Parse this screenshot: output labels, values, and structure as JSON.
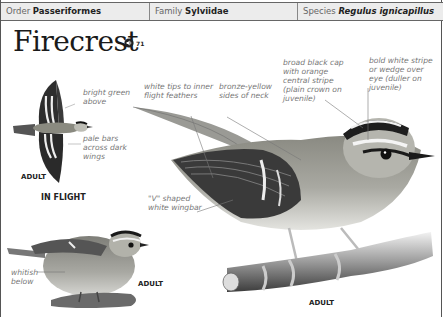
{
  "header": {
    "order": {
      "label": "Order",
      "value": "Passeriformes"
    },
    "family": {
      "label": "Family",
      "value": "Sylviidae"
    },
    "species": {
      "label": "Species",
      "value": "Regulus ignicapillus"
    }
  },
  "title": "Firecrest",
  "audio": {
    "icon": "speaker-icon",
    "track": "71"
  },
  "annotations": {
    "bright_green": "bright green above",
    "pale_bars": "pale bars across dark wings",
    "white_tips": "white tips to inner flight feathers",
    "bronze_yellow": "bronze-yellow sides of neck",
    "black_cap": "broad black cap with orange central stripe (plain crown on juvenile)",
    "white_stripe": "bold white stripe or wedge over eye (duller on juvenile)",
    "v_wingbar": "\"V\" shaped white wingbar",
    "whitish_below": "whitish below"
  },
  "captions": {
    "flight_adult": "ADULT",
    "in_flight": "IN FLIGHT",
    "perched_adult": "ADULT",
    "main_adult": "ADULT"
  }
}
